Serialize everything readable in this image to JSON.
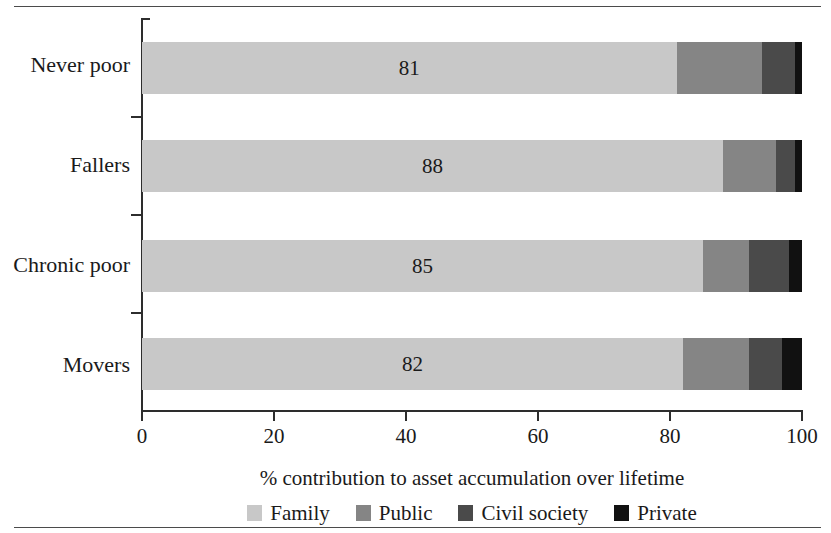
{
  "chart_data": {
    "type": "bar",
    "orientation": "horizontal",
    "stacked": true,
    "normalized_percent": true,
    "title": "",
    "xlabel": "% contribution to asset accumulation over lifetime",
    "ylabel": "",
    "xlim": [
      0,
      100
    ],
    "xticks": [
      0,
      20,
      40,
      60,
      80,
      100
    ],
    "xticklabels": [
      "0",
      "20",
      "40",
      "60",
      "80",
      "100"
    ],
    "grid": false,
    "legend_position": "bottom-center",
    "categories": [
      "Never poor",
      "Fallers",
      "Chronic poor",
      "Movers"
    ],
    "series": [
      {
        "name": "Family",
        "color": "#c8c8c8",
        "values": [
          81,
          88,
          85,
          82
        ]
      },
      {
        "name": "Public",
        "color": "#858585",
        "values": [
          13,
          8,
          7,
          10
        ]
      },
      {
        "name": "Civil society",
        "color": "#4a4a4a",
        "values": [
          5,
          3,
          6,
          5
        ]
      },
      {
        "name": "Private",
        "color": "#111111",
        "values": [
          1,
          1,
          2,
          3
        ]
      }
    ],
    "data_labels": [
      "81",
      "88",
      "85",
      "82"
    ],
    "data_label_series": "Family"
  },
  "legend": {
    "items": [
      {
        "label": "Family",
        "color": "#c8c8c8"
      },
      {
        "label": "Public",
        "color": "#858585"
      },
      {
        "label": "Civil society",
        "color": "#4a4a4a"
      },
      {
        "label": "Private",
        "color": "#111111"
      }
    ]
  },
  "axis": {
    "x_title": "% contribution to asset accumulation over lifetime",
    "x_ticklabels": [
      "0",
      "20",
      "40",
      "60",
      "80",
      "100"
    ],
    "y_ticklabels": [
      "Never poor",
      "Fallers",
      "Chronic poor",
      "Movers"
    ]
  }
}
